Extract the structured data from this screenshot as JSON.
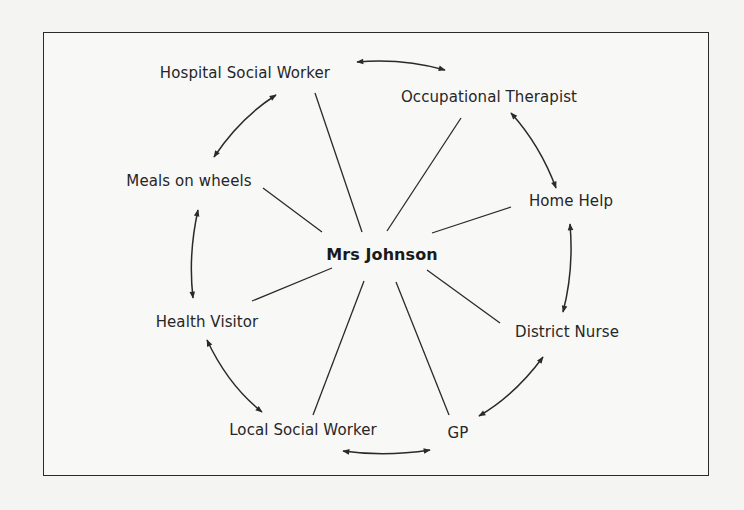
{
  "diagram": {
    "type": "network",
    "center": {
      "label": "Mrs Johnson"
    },
    "nodes": [
      {
        "id": "hsw",
        "label": "Hospital Social Worker"
      },
      {
        "id": "ot",
        "label": "Occupational Therapist"
      },
      {
        "id": "mow",
        "label": "Meals on wheels"
      },
      {
        "id": "hh",
        "label": "Home Help"
      },
      {
        "id": "hv",
        "label": "Health Visitor"
      },
      {
        "id": "dn",
        "label": "District Nurse"
      },
      {
        "id": "lsw",
        "label": "Local Social Worker"
      },
      {
        "id": "gp",
        "label": "GP"
      }
    ],
    "spokes": [
      "hsw",
      "ot",
      "mow",
      "hh",
      "hv",
      "dn",
      "lsw",
      "gp"
    ],
    "two_way_arrows": [
      [
        "hsw",
        "ot"
      ],
      [
        "hsw",
        "mow"
      ],
      [
        "ot",
        "hh"
      ],
      [
        "hh",
        "dn"
      ],
      [
        "mow",
        "hv"
      ],
      [
        "hv",
        "lsw"
      ],
      [
        "lsw",
        "gp"
      ],
      [
        "dn",
        "gp"
      ]
    ],
    "colors": {
      "line": "#2a2a2a",
      "text": "#262626",
      "background": "#f8f8f7"
    }
  }
}
